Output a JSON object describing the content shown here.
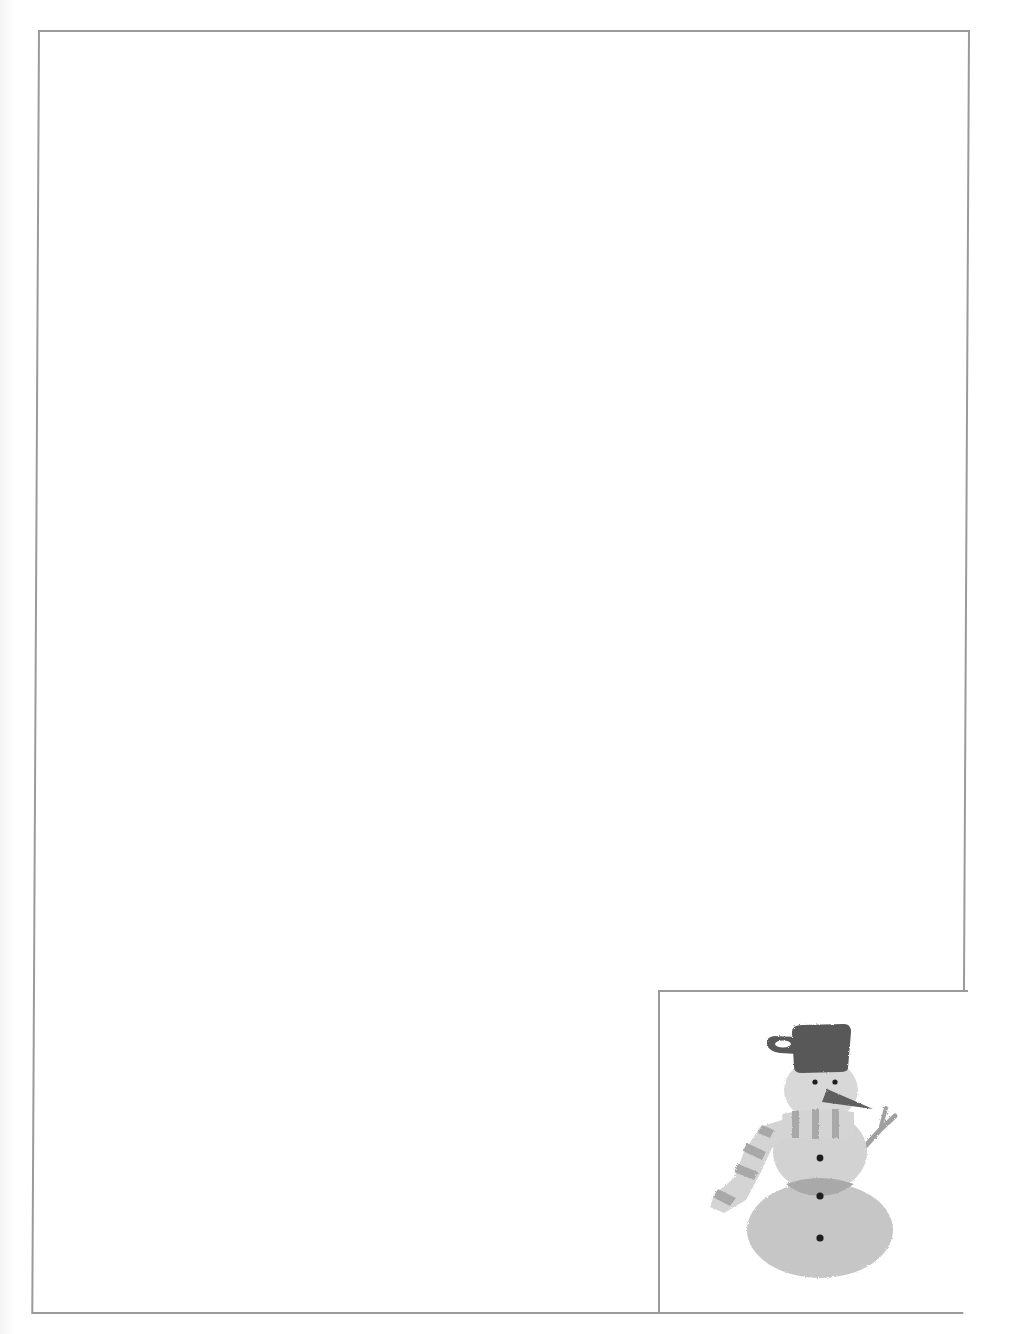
{
  "page": {
    "type": "blank stationery page",
    "background_color": "#ffffff",
    "border_color": "#9a9a9a"
  },
  "writing_area": {
    "text": ""
  },
  "illustration": {
    "subject": "snowman",
    "alt": "Snowman wearing a mug-shaped hat and a striped scarf",
    "parts": [
      "hat",
      "head",
      "eyes",
      "carrot-nose",
      "scarf",
      "twig-arm",
      "middle-body",
      "bottom-body",
      "buttons"
    ],
    "button_count": 3,
    "colors": {
      "hat": "#585858",
      "nose": "#5e5e5e",
      "head": "#d8d8d8",
      "middle_body": "#d2d2d2",
      "bottom_body": "#c6c6c6",
      "shadow": "#a9a9a9",
      "scarf_light": "#d4d4d4",
      "scarf_stripe": "#a8a8a8",
      "arm": "#a0a0a0",
      "eyes_buttons": "#1e1e1e"
    }
  }
}
